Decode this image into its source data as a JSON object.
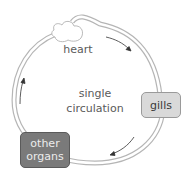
{
  "diagram": {
    "labels": {
      "heart": "heart",
      "center_line1": "single",
      "center_line2": "circulation"
    },
    "nodes": [
      {
        "id": "gills",
        "label": "gills",
        "fill": "#d9d9d9",
        "text_color": "#3a3a3a"
      },
      {
        "id": "other-organs",
        "label_line1": "other",
        "label_line2": "organs",
        "fill": "#7a7a7a",
        "text_color": "#e8e8e8"
      }
    ],
    "flow": [
      "heart",
      "gills",
      "other organs",
      "heart"
    ],
    "colors": {
      "vessel": "#9a9a9a",
      "arrow": "#333333"
    }
  }
}
